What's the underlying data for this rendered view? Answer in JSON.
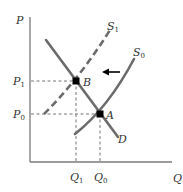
{
  "diagram": {
    "axes": {
      "y_label": "P",
      "x_label": "Q"
    },
    "price_ticks": [
      {
        "main": "P",
        "sub": "1"
      },
      {
        "main": "P",
        "sub": "0"
      }
    ],
    "quantity_ticks": [
      {
        "main": "Q",
        "sub": "1"
      },
      {
        "main": "Q",
        "sub": "0"
      }
    ],
    "curves": {
      "demand": {
        "label": "D",
        "style": "solid"
      },
      "supply_new": {
        "label": "S",
        "sub": "1",
        "style": "dashed"
      },
      "supply_old": {
        "label": "S",
        "sub": "0",
        "style": "solid"
      }
    },
    "points": [
      {
        "label": "B",
        "desc": "new equilibrium (Q1, P1)"
      },
      {
        "label": "A",
        "desc": "original equilibrium (Q0, P0)"
      }
    ],
    "shift_arrow": {
      "direction": "left"
    },
    "colors": {
      "curve": "#6b6b6b",
      "axis": "#7a7a7a",
      "guide": "#666666",
      "point": "#000000",
      "text": "#333333"
    }
  }
}
